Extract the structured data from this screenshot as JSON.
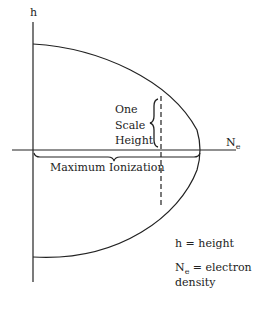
{
  "diagram": {
    "y_axis_label": "h",
    "x_axis_label": "N",
    "x_axis_subscript": "e",
    "scale_height_lines": [
      "One",
      "Scale",
      "Height"
    ],
    "max_ionization_label": "Maximum Ionization",
    "legend": {
      "h_def": "h = height",
      "ne_symbol": "N",
      "ne_subscript": "e",
      "ne_def": " = electron",
      "ne_def_line2": "density"
    }
  }
}
